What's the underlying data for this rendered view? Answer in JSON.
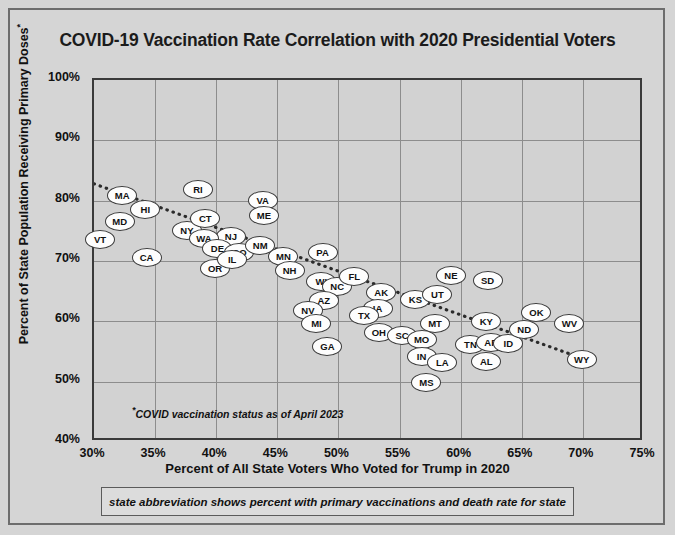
{
  "title": "COVID-19 Vaccination Rate Correlation with 2020 Presidential Voters",
  "footnote": "COVID vaccination status as of April 2023",
  "footnote_marker": "*",
  "caption": "state abbreviation shows percent with primary vaccinations and death rate for state",
  "colors": {
    "page_background": "#d5d5d5",
    "plot_background": "#d2d2d2",
    "grid": "#8d8d8d",
    "axis": "#3a3a3a",
    "marker_fill": "#fdfdfd",
    "marker_stroke": "#3a3a3a",
    "text": "#111111"
  },
  "chart_data": {
    "type": "scatter",
    "title": "COVID-19 Vaccination Rate Correlation with 2020 Presidential Voters",
    "xlabel": "Percent of All State Voters Who Voted for Trump in 2020",
    "ylabel": "Percent of State Population Receiving Primary Doses*",
    "xlim": [
      30,
      75
    ],
    "ylim": [
      40,
      100
    ],
    "xticks": [
      "30%",
      "35%",
      "40%",
      "45%",
      "50%",
      "55%",
      "60%",
      "65%",
      "70%",
      "75%"
    ],
    "xtick_values": [
      30,
      35,
      40,
      45,
      50,
      55,
      60,
      65,
      70,
      75
    ],
    "yticks": [
      "40%",
      "50%",
      "60%",
      "70%",
      "80%",
      "90%",
      "100%"
    ],
    "ytick_values": [
      40,
      50,
      60,
      70,
      80,
      90,
      100
    ],
    "grid": true,
    "legend": "none",
    "point_label_field": "state",
    "trendline": {
      "type": "linear-dotted",
      "x_start": 30.0,
      "y_start": 82.6,
      "x_end": 69.9,
      "y_end": 53.6
    },
    "points": [
      {
        "state": "VT",
        "x": 30.5,
        "y": 73.6
      },
      {
        "state": "MA",
        "x": 32.3,
        "y": 80.9
      },
      {
        "state": "MD",
        "x": 32.1,
        "y": 76.5
      },
      {
        "state": "HI",
        "x": 34.2,
        "y": 78.5
      },
      {
        "state": "CA",
        "x": 34.3,
        "y": 70.5
      },
      {
        "state": "NY",
        "x": 37.6,
        "y": 75.0
      },
      {
        "state": "CT",
        "x": 39.1,
        "y": 77.0
      },
      {
        "state": "RI",
        "x": 38.5,
        "y": 81.8
      },
      {
        "state": "NJ",
        "x": 41.2,
        "y": 74.0
      },
      {
        "state": "VA",
        "x": 43.8,
        "y": 80.1
      },
      {
        "state": "ME",
        "x": 43.9,
        "y": 77.5
      },
      {
        "state": "WA",
        "x": 39.0,
        "y": 73.7
      },
      {
        "state": "DE",
        "x": 40.1,
        "y": 72.0
      },
      {
        "state": "OR",
        "x": 39.9,
        "y": 68.8
      },
      {
        "state": "CO",
        "x": 41.9,
        "y": 71.4
      },
      {
        "state": "NM",
        "x": 43.6,
        "y": 72.5
      },
      {
        "state": "IL",
        "x": 41.3,
        "y": 70.2
      },
      {
        "state": "MN",
        "x": 45.5,
        "y": 70.7
      },
      {
        "state": "NH",
        "x": 46.0,
        "y": 68.4
      },
      {
        "state": "PA",
        "x": 48.7,
        "y": 71.4
      },
      {
        "state": "WI",
        "x": 48.6,
        "y": 66.6
      },
      {
        "state": "NC",
        "x": 49.9,
        "y": 65.7
      },
      {
        "state": "AZ",
        "x": 48.8,
        "y": 63.4
      },
      {
        "state": "NV",
        "x": 47.5,
        "y": 61.8
      },
      {
        "state": "MI",
        "x": 48.2,
        "y": 59.6
      },
      {
        "state": "GA",
        "x": 49.1,
        "y": 55.8
      },
      {
        "state": "FL",
        "x": 51.3,
        "y": 67.4
      },
      {
        "state": "AK",
        "x": 53.5,
        "y": 64.7
      },
      {
        "state": "IA",
        "x": 53.2,
        "y": 62.2
      },
      {
        "state": "TX",
        "x": 52.1,
        "y": 60.9
      },
      {
        "state": "OH",
        "x": 53.3,
        "y": 58.1
      },
      {
        "state": "SC",
        "x": 55.2,
        "y": 57.6
      },
      {
        "state": "KS",
        "x": 56.3,
        "y": 63.7
      },
      {
        "state": "UT",
        "x": 58.1,
        "y": 64.5
      },
      {
        "state": "NE",
        "x": 59.2,
        "y": 67.6
      },
      {
        "state": "MT",
        "x": 57.9,
        "y": 59.7
      },
      {
        "state": "MO",
        "x": 56.8,
        "y": 57.0
      },
      {
        "state": "IN",
        "x": 56.8,
        "y": 54.1
      },
      {
        "state": "LA",
        "x": 58.5,
        "y": 53.1
      },
      {
        "state": "MS",
        "x": 57.2,
        "y": 49.8
      },
      {
        "state": "SD",
        "x": 62.2,
        "y": 66.7
      },
      {
        "state": "KY",
        "x": 62.1,
        "y": 59.9
      },
      {
        "state": "TN",
        "x": 60.8,
        "y": 56.1
      },
      {
        "state": "AR",
        "x": 62.5,
        "y": 56.5
      },
      {
        "state": "ID",
        "x": 63.9,
        "y": 56.3
      },
      {
        "state": "AL",
        "x": 62.1,
        "y": 53.3
      },
      {
        "state": "OK",
        "x": 66.2,
        "y": 61.4
      },
      {
        "state": "ND",
        "x": 65.2,
        "y": 58.7
      },
      {
        "state": "WV",
        "x": 68.9,
        "y": 59.7
      },
      {
        "state": "WY",
        "x": 69.9,
        "y": 53.6
      }
    ]
  }
}
